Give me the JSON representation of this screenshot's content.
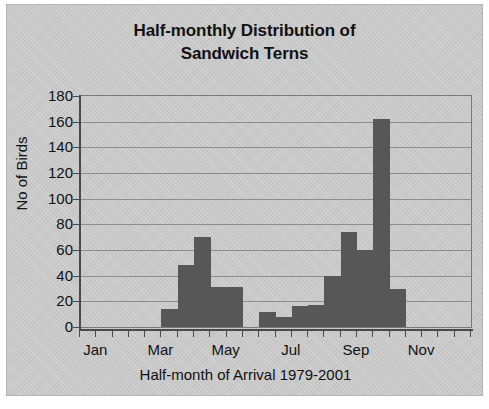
{
  "chart_data": {
    "type": "bar",
    "title_line1": "Half-monthly Distribution of",
    "title_line2": "Sandwich Terns",
    "xlabel": "Half-month of Arrival 1979-2001",
    "ylabel": "No of Birds",
    "ylim": [
      0,
      180
    ],
    "ytick_labels": [
      "180",
      "160",
      "140",
      "120",
      "100",
      "80",
      "60",
      "40",
      "20",
      "0"
    ],
    "ytick_values": [
      180,
      160,
      140,
      120,
      100,
      80,
      60,
      40,
      20,
      0
    ],
    "xtick_labels": [
      "Jan",
      "Mar",
      "May",
      "Jul",
      "Sep",
      "Nov"
    ],
    "xtick_bin_index": [
      0,
      4,
      8,
      12,
      16,
      20
    ],
    "grid": true,
    "legend": false,
    "bar_color": "#575757",
    "plot_background": "#c9c9c9",
    "axis_color": "#4a4a4a",
    "n_bins": 24,
    "categories": [
      "Jan-1",
      "Jan-2",
      "Feb-1",
      "Feb-2",
      "Mar-1",
      "Mar-2",
      "Apr-1",
      "Apr-2",
      "May-1",
      "May-2",
      "Jun-1",
      "Jun-2",
      "Jul-1",
      "Jul-2",
      "Aug-1",
      "Aug-2",
      "Sep-1",
      "Sep-2",
      "Oct-1",
      "Oct-2",
      "Nov-1",
      "Nov-2",
      "Dec-1",
      "Dec-2"
    ],
    "values": [
      0,
      0,
      0,
      0,
      0,
      14,
      48,
      70,
      31,
      31,
      0,
      12,
      8,
      16,
      17,
      40,
      74,
      60,
      162,
      30,
      0,
      0,
      0,
      0
    ]
  }
}
